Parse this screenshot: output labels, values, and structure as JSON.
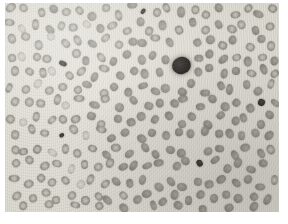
{
  "figure": {
    "kind": "micrograph",
    "modality": "light microscopy, Romanowsky-type stain, reproduced in greyscale",
    "caption": "",
    "title": "",
    "label": "",
    "scale_bar": "",
    "magnification": ""
  },
  "palette": {
    "paper": "#ffffff",
    "background_plasma": "#e2e0d7",
    "erythrocyte_rim": "#8e8b83",
    "erythrocyte_centre": "#c3c0b6",
    "platelet_dark": "#2f2d2a",
    "leukocyte_nucleus": "#232120"
  },
  "plate": {
    "left": 5,
    "top": 3,
    "width": 274,
    "height": 209
  },
  "objects": {
    "leukocytes": [
      {
        "name": "leukocyte-nucleus",
        "cx": 181,
        "cy": 66,
        "r": 9.5
      }
    ],
    "platelets": [
      {
        "name": "platelet-top",
        "cx": 143,
        "cy": 11,
        "rx": 3.0,
        "ry": 2.2
      },
      {
        "name": "platelet-left-upper",
        "cx": 63,
        "cy": 63,
        "rx": 4.0,
        "ry": 2.4
      },
      {
        "name": "platelet-right",
        "cx": 262,
        "cy": 102,
        "rx": 3.6,
        "ry": 3.4
      },
      {
        "name": "platelet-left-lower",
        "cx": 62,
        "cy": 135,
        "rx": 2.6,
        "ry": 2.2
      },
      {
        "name": "platelet-centre-lower",
        "cx": 199,
        "cy": 163,
        "rx": 3.4,
        "ry": 3.2
      }
    ],
    "counts": {
      "erythrocytes_visible": 268,
      "platelets_visible": 5,
      "leukocytes_visible": 1
    }
  },
  "erythrocytes": [
    [
      12,
      10,
      9.0,
      "rbc"
    ],
    [
      26,
      8,
      8.6,
      "rbc"
    ],
    [
      39,
      12,
      8.2,
      "rbc"
    ],
    [
      52,
      7,
      8.8,
      "rbc-solid"
    ],
    [
      65,
      13,
      8.4,
      "rbc"
    ],
    [
      78,
      9,
      8.0,
      "rbc"
    ],
    [
      91,
      14,
      8.6,
      "rbc-solid"
    ],
    [
      104,
      8,
      8.2,
      "rbc"
    ],
    [
      117,
      13,
      8.8,
      "rbc"
    ],
    [
      130,
      7,
      8.0,
      "rbc-solid"
    ],
    [
      156,
      11,
      8.6,
      "rbc"
    ],
    [
      169,
      7,
      8.2,
      "rbc"
    ],
    [
      182,
      13,
      9.0,
      "rbc-solid"
    ],
    [
      195,
      8,
      8.4,
      "rbc"
    ],
    [
      208,
      13,
      8.0,
      "rbc"
    ],
    [
      221,
      8,
      8.8,
      "rbc-solid"
    ],
    [
      234,
      13,
      8.4,
      "rbc"
    ],
    [
      247,
      8,
      8.0,
      "rbc"
    ],
    [
      260,
      13,
      8.6,
      "rbc-solid"
    ],
    [
      272,
      8,
      8.2,
      "rbc"
    ],
    [
      9,
      24,
      8.4,
      "rbc"
    ],
    [
      22,
      27,
      8.0,
      "rbc-pale"
    ],
    [
      35,
      23,
      8.8,
      "rbc"
    ],
    [
      48,
      28,
      8.4,
      "rbc-solid"
    ],
    [
      61,
      24,
      8.0,
      "rbc"
    ],
    [
      74,
      29,
      8.6,
      "rbc"
    ],
    [
      87,
      24,
      8.2,
      "rbc-pale"
    ],
    [
      100,
      29,
      8.8,
      "rbc-solid"
    ],
    [
      113,
      24,
      8.4,
      "rbc"
    ],
    [
      126,
      29,
      8.0,
      "rbc"
    ],
    [
      139,
      24,
      8.6,
      "rbc-solid"
    ],
    [
      152,
      29,
      8.2,
      "rbc"
    ],
    [
      165,
      24,
      8.8,
      "rbc-solid"
    ],
    [
      178,
      29,
      8.4,
      "rbc"
    ],
    [
      191,
      24,
      8.0,
      "rbc-solid"
    ],
    [
      204,
      29,
      8.6,
      "rbc"
    ],
    [
      217,
      24,
      8.2,
      "rbc-solid"
    ],
    [
      230,
      29,
      8.8,
      "rbc"
    ],
    [
      243,
      24,
      8.4,
      "rbc"
    ],
    [
      256,
      29,
      8.0,
      "rbc-solid"
    ],
    [
      269,
      24,
      8.6,
      "rbc"
    ],
    [
      13,
      41,
      8.8,
      "rbc"
    ],
    [
      27,
      38,
      8.2,
      "rbc"
    ],
    [
      40,
      43,
      8.6,
      "rbc"
    ],
    [
      53,
      39,
      8.0,
      "rbc-pale"
    ],
    [
      66,
      44,
      8.4,
      "rbc"
    ],
    [
      79,
      39,
      8.8,
      "rbc"
    ],
    [
      92,
      44,
      8.2,
      "rbc-solid"
    ],
    [
      105,
      39,
      8.6,
      "rbc"
    ],
    [
      118,
      44,
      8.0,
      "rbc"
    ],
    [
      131,
      39,
      8.4,
      "rbc-solid"
    ],
    [
      144,
      44,
      8.8,
      "rbc-solid"
    ],
    [
      157,
      39,
      8.2,
      "rbc"
    ],
    [
      170,
      44,
      8.6,
      "rbc-solid"
    ],
    [
      196,
      44,
      8.0,
      "rbc-solid"
    ],
    [
      209,
      39,
      8.8,
      "rbc-solid"
    ],
    [
      222,
      44,
      8.2,
      "rbc"
    ],
    [
      235,
      39,
      8.6,
      "rbc-solid"
    ],
    [
      248,
      44,
      8.0,
      "rbc"
    ],
    [
      261,
      39,
      8.4,
      "rbc-solid"
    ],
    [
      273,
      44,
      8.8,
      "rbc"
    ],
    [
      10,
      56,
      8.2,
      "rbc"
    ],
    [
      23,
      59,
      8.6,
      "rbc-pale"
    ],
    [
      36,
      55,
      8.0,
      "rbc"
    ],
    [
      49,
      60,
      8.4,
      "rbc"
    ],
    [
      75,
      55,
      8.8,
      "rbc"
    ],
    [
      88,
      60,
      8.2,
      "rbc-solid"
    ],
    [
      101,
      55,
      8.6,
      "rbc"
    ],
    [
      114,
      60,
      8.0,
      "rbc-solid"
    ],
    [
      127,
      55,
      8.4,
      "rbc-solid"
    ],
    [
      140,
      60,
      8.8,
      "rbc-solid"
    ],
    [
      153,
      55,
      8.2,
      "rbc-solid"
    ],
    [
      166,
      60,
      8.6,
      "rbc-solid"
    ],
    [
      197,
      59,
      8.0,
      "rbc-solid"
    ],
    [
      210,
      55,
      8.4,
      "rbc-solid"
    ],
    [
      223,
      60,
      8.8,
      "rbc-solid"
    ],
    [
      236,
      55,
      8.2,
      "rbc"
    ],
    [
      249,
      60,
      8.6,
      "rbc-solid"
    ],
    [
      262,
      55,
      8.0,
      "rbc"
    ],
    [
      274,
      60,
      8.4,
      "rbc-solid"
    ],
    [
      14,
      72,
      8.6,
      "rbc"
    ],
    [
      28,
      69,
      8.0,
      "rbc"
    ],
    [
      41,
      74,
      8.4,
      "rbc"
    ],
    [
      54,
      70,
      8.8,
      "rbc-pale"
    ],
    [
      67,
      75,
      8.2,
      "rbc"
    ],
    [
      80,
      70,
      8.6,
      "rbc"
    ],
    [
      93,
      75,
      8.0,
      "rbc-solid"
    ],
    [
      106,
      70,
      8.4,
      "rbc"
    ],
    [
      119,
      75,
      8.8,
      "rbc-solid"
    ],
    [
      132,
      70,
      8.2,
      "rbc-solid"
    ],
    [
      145,
      75,
      8.6,
      "rbc-solid"
    ],
    [
      158,
      70,
      8.0,
      "rbc-solid"
    ],
    [
      198,
      74,
      8.8,
      "rbc-solid"
    ],
    [
      211,
      70,
      8.2,
      "rbc-solid"
    ],
    [
      224,
      75,
      8.6,
      "rbc-solid"
    ],
    [
      237,
      70,
      8.0,
      "rbc-solid"
    ],
    [
      250,
      75,
      8.4,
      "rbc"
    ],
    [
      263,
      70,
      8.8,
      "rbc-solid"
    ],
    [
      275,
      75,
      8.2,
      "rbc"
    ],
    [
      11,
      87,
      8.0,
      "rbc"
    ],
    [
      24,
      90,
      8.4,
      "rbc"
    ],
    [
      37,
      86,
      8.8,
      "rbc-pale"
    ],
    [
      50,
      91,
      8.2,
      "rbc"
    ],
    [
      63,
      86,
      8.6,
      "rbc"
    ],
    [
      76,
      91,
      8.0,
      "rbc"
    ],
    [
      89,
      86,
      8.4,
      "rbc-solid"
    ],
    [
      102,
      91,
      8.8,
      "rbc"
    ],
    [
      115,
      86,
      8.2,
      "rbc-solid"
    ],
    [
      128,
      91,
      8.6,
      "rbc-solid"
    ],
    [
      141,
      86,
      8.0,
      "rbc-solid"
    ],
    [
      154,
      91,
      8.4,
      "rbc-solid"
    ],
    [
      167,
      86,
      8.8,
      "rbc-solid"
    ],
    [
      180,
      91,
      8.2,
      "rbc-solid"
    ],
    [
      193,
      86,
      8.6,
      "rbc-solid"
    ],
    [
      206,
      91,
      8.0,
      "rbc-solid"
    ],
    [
      219,
      86,
      8.4,
      "rbc-solid"
    ],
    [
      232,
      91,
      8.8,
      "rbc-solid"
    ],
    [
      245,
      86,
      8.2,
      "rbc-solid"
    ],
    [
      258,
      91,
      8.6,
      "rbc-solid"
    ],
    [
      271,
      86,
      8.0,
      "rbc"
    ],
    [
      15,
      103,
      8.4,
      "rbc"
    ],
    [
      29,
      100,
      8.8,
      "rbc"
    ],
    [
      42,
      105,
      8.2,
      "rbc"
    ],
    [
      55,
      101,
      8.6,
      "rbc"
    ],
    [
      68,
      106,
      8.0,
      "rbc-pale"
    ],
    [
      81,
      101,
      8.4,
      "rbc"
    ],
    [
      94,
      106,
      8.8,
      "rbc-solid"
    ],
    [
      107,
      101,
      8.2,
      "rbc"
    ],
    [
      120,
      106,
      8.6,
      "rbc-solid"
    ],
    [
      133,
      101,
      8.0,
      "rbc-solid"
    ],
    [
      146,
      106,
      8.4,
      "rbc-solid"
    ],
    [
      159,
      101,
      8.8,
      "rbc-solid"
    ],
    [
      172,
      106,
      8.2,
      "rbc-solid"
    ],
    [
      185,
      101,
      8.6,
      "rbc-solid"
    ],
    [
      198,
      106,
      8.0,
      "rbc-solid"
    ],
    [
      211,
      101,
      8.4,
      "rbc-solid"
    ],
    [
      224,
      106,
      8.8,
      "rbc-solid"
    ],
    [
      237,
      101,
      8.2,
      "rbc-solid"
    ],
    [
      250,
      106,
      8.6,
      "rbc-solid"
    ],
    [
      274,
      101,
      8.0,
      "rbc-solid"
    ],
    [
      12,
      118,
      8.8,
      "rbc"
    ],
    [
      25,
      121,
      8.2,
      "rbc-pale"
    ],
    [
      38,
      117,
      8.6,
      "rbc"
    ],
    [
      51,
      122,
      8.0,
      "rbc"
    ],
    [
      64,
      117,
      8.4,
      "rbc"
    ],
    [
      77,
      122,
      8.8,
      "rbc"
    ],
    [
      90,
      117,
      8.2,
      "rbc-solid"
    ],
    [
      103,
      122,
      8.6,
      "rbc"
    ],
    [
      116,
      117,
      8.0,
      "rbc-solid"
    ],
    [
      129,
      122,
      8.4,
      "rbc-solid"
    ],
    [
      142,
      117,
      8.8,
      "rbc-solid"
    ],
    [
      155,
      122,
      8.2,
      "rbc-solid"
    ],
    [
      168,
      117,
      8.6,
      "rbc-solid"
    ],
    [
      181,
      122,
      8.0,
      "rbc-solid"
    ],
    [
      194,
      117,
      8.4,
      "rbc-solid"
    ],
    [
      207,
      122,
      8.8,
      "rbc-solid"
    ],
    [
      220,
      117,
      8.2,
      "rbc-solid"
    ],
    [
      233,
      122,
      8.6,
      "rbc-solid"
    ],
    [
      246,
      117,
      8.0,
      "rbc-solid"
    ],
    [
      259,
      122,
      8.4,
      "rbc-solid"
    ],
    [
      272,
      117,
      8.8,
      "rbc-solid"
    ],
    [
      16,
      134,
      8.2,
      "rbc"
    ],
    [
      30,
      131,
      8.6,
      "rbc"
    ],
    [
      43,
      136,
      8.0,
      "rbc"
    ],
    [
      75,
      131,
      8.8,
      "rbc"
    ],
    [
      88,
      136,
      8.2,
      "rbc-pale"
    ],
    [
      101,
      131,
      8.6,
      "rbc"
    ],
    [
      114,
      136,
      8.0,
      "rbc-solid"
    ],
    [
      127,
      131,
      8.4,
      "rbc-solid"
    ],
    [
      140,
      136,
      8.8,
      "rbc-solid"
    ],
    [
      153,
      131,
      8.2,
      "rbc-solid"
    ],
    [
      166,
      136,
      8.6,
      "rbc-solid"
    ],
    [
      179,
      131,
      8.0,
      "rbc-solid"
    ],
    [
      192,
      136,
      8.4,
      "rbc-solid"
    ],
    [
      205,
      131,
      8.8,
      "rbc-solid"
    ],
    [
      218,
      136,
      8.2,
      "rbc-solid"
    ],
    [
      231,
      131,
      8.6,
      "rbc-solid"
    ],
    [
      244,
      136,
      8.0,
      "rbc-solid"
    ],
    [
      257,
      131,
      8.4,
      "rbc-solid"
    ],
    [
      270,
      136,
      8.8,
      "rbc-solid"
    ],
    [
      13,
      149,
      8.6,
      "rbc"
    ],
    [
      26,
      152,
      8.0,
      "rbc"
    ],
    [
      39,
      148,
      8.4,
      "rbc"
    ],
    [
      52,
      153,
      8.8,
      "rbc-pale"
    ],
    [
      65,
      148,
      8.2,
      "rbc"
    ],
    [
      78,
      153,
      8.6,
      "rbc"
    ],
    [
      91,
      148,
      8.0,
      "rbc"
    ],
    [
      104,
      153,
      8.4,
      "rbc-solid"
    ],
    [
      117,
      148,
      8.8,
      "rbc"
    ],
    [
      130,
      153,
      8.2,
      "rbc-solid"
    ],
    [
      143,
      148,
      8.6,
      "rbc-solid"
    ],
    [
      156,
      153,
      8.0,
      "rbc-solid"
    ],
    [
      169,
      148,
      8.4,
      "rbc-solid"
    ],
    [
      182,
      153,
      8.8,
      "rbc-solid"
    ],
    [
      208,
      153,
      8.6,
      "rbc-solid"
    ],
    [
      221,
      148,
      8.0,
      "rbc-solid"
    ],
    [
      234,
      153,
      8.4,
      "rbc-solid"
    ],
    [
      247,
      148,
      8.8,
      "rbc-solid"
    ],
    [
      260,
      153,
      8.2,
      "rbc-solid"
    ],
    [
      273,
      148,
      8.6,
      "rbc"
    ],
    [
      17,
      165,
      8.0,
      "rbc"
    ],
    [
      31,
      162,
      8.4,
      "rbc"
    ],
    [
      44,
      167,
      8.8,
      "rbc"
    ],
    [
      57,
      163,
      8.2,
      "rbc"
    ],
    [
      70,
      168,
      8.6,
      "rbc-pale"
    ],
    [
      83,
      163,
      8.0,
      "rbc"
    ],
    [
      96,
      168,
      8.4,
      "rbc"
    ],
    [
      109,
      163,
      8.8,
      "rbc"
    ],
    [
      122,
      168,
      8.2,
      "rbc-solid"
    ],
    [
      135,
      163,
      8.6,
      "rbc-solid"
    ],
    [
      148,
      168,
      8.0,
      "rbc-solid"
    ],
    [
      161,
      163,
      8.4,
      "rbc-solid"
    ],
    [
      174,
      168,
      8.8,
      "rbc-solid"
    ],
    [
      187,
      163,
      8.2,
      "rbc-solid"
    ],
    [
      213,
      163,
      8.0,
      "rbc-solid"
    ],
    [
      226,
      168,
      8.4,
      "rbc-solid"
    ],
    [
      239,
      163,
      8.8,
      "rbc-solid"
    ],
    [
      252,
      168,
      8.2,
      "rbc-solid"
    ],
    [
      265,
      163,
      8.6,
      "rbc-solid"
    ],
    [
      14,
      181,
      8.4,
      "rbc"
    ],
    [
      27,
      184,
      8.8,
      "rbc"
    ],
    [
      40,
      180,
      8.2,
      "rbc"
    ],
    [
      53,
      185,
      8.6,
      "rbc"
    ],
    [
      66,
      180,
      8.0,
      "rbc"
    ],
    [
      79,
      185,
      8.4,
      "rbc-pale"
    ],
    [
      92,
      180,
      8.8,
      "rbc"
    ],
    [
      105,
      185,
      8.2,
      "rbc"
    ],
    [
      118,
      180,
      8.6,
      "rbc-solid"
    ],
    [
      131,
      185,
      8.0,
      "rbc-solid"
    ],
    [
      144,
      180,
      8.4,
      "rbc-solid"
    ],
    [
      157,
      185,
      8.8,
      "rbc-solid"
    ],
    [
      170,
      180,
      8.2,
      "rbc-solid"
    ],
    [
      183,
      185,
      8.6,
      "rbc-solid"
    ],
    [
      196,
      180,
      8.0,
      "rbc-solid"
    ],
    [
      209,
      185,
      8.4,
      "rbc-solid"
    ],
    [
      222,
      180,
      8.8,
      "rbc-solid"
    ],
    [
      235,
      185,
      8.2,
      "rbc-solid"
    ],
    [
      248,
      180,
      8.6,
      "rbc-solid"
    ],
    [
      261,
      185,
      8.0,
      "rbc-solid"
    ],
    [
      274,
      180,
      8.4,
      "rbc"
    ],
    [
      18,
      196,
      8.8,
      "rbc"
    ],
    [
      32,
      199,
      8.2,
      "rbc"
    ],
    [
      45,
      195,
      8.6,
      "rbc"
    ],
    [
      58,
      200,
      8.0,
      "rbc"
    ],
    [
      71,
      195,
      8.4,
      "rbc"
    ],
    [
      84,
      200,
      8.8,
      "rbc"
    ],
    [
      97,
      195,
      8.2,
      "rbc"
    ],
    [
      110,
      200,
      8.6,
      "rbc-solid"
    ],
    [
      123,
      195,
      8.0,
      "rbc"
    ],
    [
      136,
      200,
      8.4,
      "rbc-solid"
    ],
    [
      149,
      195,
      8.8,
      "rbc-solid"
    ],
    [
      162,
      200,
      8.2,
      "rbc-solid"
    ],
    [
      175,
      195,
      8.6,
      "rbc-solid"
    ],
    [
      188,
      200,
      8.0,
      "rbc-solid"
    ],
    [
      201,
      195,
      8.4,
      "rbc-solid"
    ],
    [
      214,
      200,
      8.8,
      "rbc-solid"
    ],
    [
      227,
      195,
      8.2,
      "rbc-solid"
    ],
    [
      240,
      200,
      8.6,
      "rbc-solid"
    ],
    [
      253,
      195,
      8.0,
      "rbc-solid"
    ],
    [
      266,
      200,
      8.4,
      "rbc-solid"
    ],
    [
      22,
      207,
      8.2,
      "rbc"
    ],
    [
      48,
      207,
      8.6,
      "rbc"
    ],
    [
      74,
      207,
      8.0,
      "rbc"
    ],
    [
      100,
      207,
      8.4,
      "rbc"
    ],
    [
      126,
      207,
      8.8,
      "rbc-solid"
    ],
    [
      152,
      207,
      8.2,
      "rbc-solid"
    ],
    [
      178,
      207,
      8.6,
      "rbc-solid"
    ],
    [
      204,
      207,
      8.0,
      "rbc-solid"
    ],
    [
      230,
      207,
      8.4,
      "rbc-solid"
    ],
    [
      256,
      207,
      8.8,
      "rbc-solid"
    ]
  ]
}
